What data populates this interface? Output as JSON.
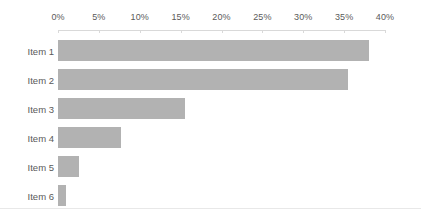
{
  "chart_data": {
    "type": "bar",
    "orientation": "horizontal",
    "title": "",
    "subtitle": "",
    "xlabel": "",
    "ylabel": "",
    "categories": [
      "Item 1",
      "Item 2",
      "Item 3",
      "Item 4",
      "Item 5",
      "Item 6"
    ],
    "values": [
      38,
      35.5,
      15.5,
      7.7,
      2.6,
      1
    ],
    "value_unit": "%",
    "series": [
      {
        "name": "Series 1",
        "values": [
          38,
          35.5,
          15.5,
          7.7,
          2.6,
          1
        ]
      }
    ],
    "xlim": [
      0,
      40
    ],
    "xticks": [
      0,
      5,
      10,
      15,
      20,
      25,
      30,
      35,
      40
    ],
    "xtick_labels": [
      "0%",
      "5%",
      "10%",
      "15%",
      "20%",
      "25%",
      "30%",
      "35%",
      "40%"
    ],
    "grid": false,
    "legend": false,
    "legend_position": "none",
    "annotations": [],
    "colors": {
      "bar": "#b2b2b2",
      "axis": "#d9d9d9",
      "text": "#5a5a5a",
      "background": "#ffffff",
      "rule": "#e8e8e8"
    }
  }
}
